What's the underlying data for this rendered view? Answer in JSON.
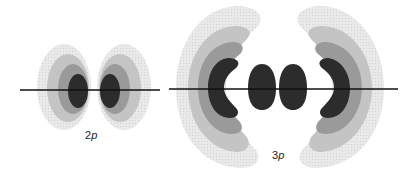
{
  "diagram": {
    "orbitals": [
      {
        "id": "2p",
        "label_num": "2",
        "label_letter": "p"
      },
      {
        "id": "3p",
        "label_num": "3",
        "label_letter": "p"
      }
    ],
    "colors": {
      "shade1": "#e6e6e6",
      "shade2": "#c4c4c4",
      "shade3": "#9a9a9a",
      "core": "#2c2c2c",
      "axis": "#111111"
    }
  }
}
